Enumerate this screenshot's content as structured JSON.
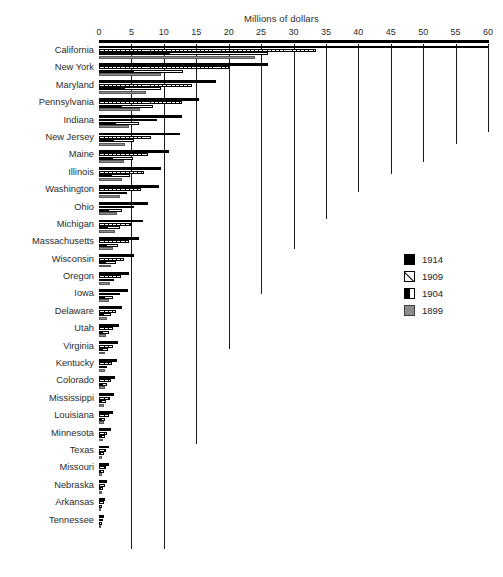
{
  "chart_data": {
    "type": "bar",
    "orientation": "horizontal",
    "title": "Millions of dollars",
    "xlabel": "Millions of dollars",
    "ylabel": "",
    "xlim": [
      0,
      60
    ],
    "xticks": [
      0,
      5,
      10,
      15,
      20,
      25,
      30,
      35,
      40,
      45,
      50,
      55,
      60
    ],
    "xtick_labels": [
      "0",
      "5",
      "10",
      "15",
      "20",
      "25",
      "30",
      "35",
      "40",
      "45",
      "50",
      "55",
      "60"
    ],
    "grid": true,
    "legend_position": "right-middle",
    "categories": [
      "California",
      "New York",
      "Maryland",
      "Pennsylvania",
      "Indiana",
      "New Jersey",
      "Maine",
      "Illinois",
      "Washington",
      "Ohio",
      "Michigan",
      "Massachusetts",
      "Wisconsin",
      "Oregon",
      "Iowa",
      "Delaware",
      "Utah",
      "Virginia",
      "Kentucky",
      "Colorado",
      "Mississippi",
      "Louisiana",
      "Minnesota",
      "Texas",
      "Missouri",
      "Nebraska",
      "Arkansas",
      "Tennessee"
    ],
    "series": [
      {
        "name": "1914",
        "color": "#000000",
        "values": [
          60.0,
          26.0,
          18.0,
          15.5,
          12.8,
          12.5,
          10.8,
          9.6,
          9.2,
          7.5,
          6.8,
          6.2,
          5.4,
          4.6,
          4.4,
          3.6,
          3.1,
          2.9,
          2.7,
          2.5,
          2.3,
          2.1,
          1.9,
          1.6,
          1.5,
          1.2,
          1.0,
          0.8
        ]
      },
      {
        "name": "1909",
        "color": "#ffffff",
        "values": [
          33.5,
          20.0,
          14.3,
          12.8,
          9.0,
          8.0,
          7.6,
          7.0,
          6.5,
          5.4,
          5.0,
          4.6,
          3.8,
          3.4,
          3.2,
          2.6,
          2.2,
          2.1,
          2.0,
          1.8,
          1.7,
          1.5,
          1.3,
          1.1,
          1.1,
          0.9,
          0.7,
          0.6
        ]
      },
      {
        "name": "1904",
        "color": "#000000",
        "values": [
          26.0,
          13.0,
          9.5,
          8.4,
          6.2,
          5.4,
          5.2,
          4.8,
          4.3,
          3.6,
          3.3,
          3.0,
          2.6,
          2.3,
          2.2,
          1.8,
          1.5,
          1.4,
          1.3,
          1.2,
          1.1,
          1.0,
          0.9,
          0.8,
          0.7,
          0.6,
          0.5,
          0.4
        ]
      },
      {
        "name": "1899",
        "color": "#8d8d8d",
        "values": [
          24.0,
          9.5,
          7.2,
          6.4,
          4.6,
          4.0,
          3.9,
          3.6,
          3.2,
          2.7,
          2.5,
          2.2,
          1.9,
          1.7,
          1.6,
          1.3,
          1.1,
          1.0,
          1.0,
          0.9,
          0.8,
          0.7,
          0.6,
          0.5,
          0.5,
          0.4,
          0.35,
          0.3
        ]
      }
    ],
    "gridline_depths": [
      {
        "value": 5,
        "depth": 505
      },
      {
        "value": 10,
        "depth": 505
      },
      {
        "value": 15,
        "depth": 400
      },
      {
        "value": 20,
        "depth": 305
      },
      {
        "value": 25,
        "depth": 250
      },
      {
        "value": 30,
        "depth": 205
      },
      {
        "value": 35,
        "depth": 175
      },
      {
        "value": 40,
        "depth": 148
      },
      {
        "value": 45,
        "depth": 130
      },
      {
        "value": 50,
        "depth": 118
      },
      {
        "value": 55,
        "depth": 100
      },
      {
        "value": 60,
        "depth": 88
      }
    ]
  },
  "legend": {
    "items": [
      {
        "label": "1914",
        "swatch": "solid-black-swatch"
      },
      {
        "label": "1909",
        "swatch": "diagonal-white-swatch"
      },
      {
        "label": "1904",
        "swatch": "half-black-swatch"
      },
      {
        "label": "1899",
        "swatch": "gray-swatch"
      }
    ]
  },
  "caption": {
    "text": ""
  }
}
